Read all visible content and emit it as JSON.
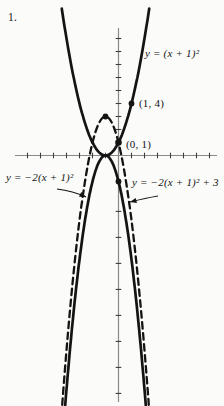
{
  "figure": {
    "number": "1.",
    "background": "#fbfbf9",
    "curve_color": "#141414",
    "axis_color": "#8a8a8a",
    "tick_color": "#3c3c3c"
  },
  "chart_data": {
    "type": "line",
    "functions": [
      {
        "label": "y = (x + 1)²",
        "a": 1,
        "h": -1,
        "k": 0,
        "style": "solid",
        "x_min": -4.36,
        "x_max": 2.36
      },
      {
        "label": "y = −2(x + 1)²",
        "a": -2,
        "h": -1,
        "k": 0,
        "style": "solid",
        "x_min": -4.1,
        "x_max": 2.1
      },
      {
        "label": "y = −2(x + 1)² + 3",
        "a": -2,
        "h": -1,
        "k": 3,
        "style": "dashed",
        "x_min": -4.33,
        "x_max": 2.33
      }
    ],
    "marked_points": [
      {
        "x": 1,
        "y": 4,
        "r": 2.9,
        "label": "(1, 4)"
      },
      {
        "x": 0,
        "y": 1,
        "r": 3.3,
        "label": "(0, 1)"
      },
      {
        "x": -1,
        "y": 3,
        "r": 2.9,
        "label": ""
      },
      {
        "x": 0,
        "y": -2,
        "r": 2.9,
        "label": ""
      }
    ],
    "axes": {
      "origin_px": {
        "x": 118.5,
        "y": 155.5
      },
      "unit_px": 13,
      "x_axis_px": {
        "y": 155.5,
        "x1": 15,
        "x2": 217
      },
      "y_axis_px": {
        "x": 118.5,
        "y1": 28,
        "y2": 402
      },
      "x_ticks": [
        -7,
        -6,
        -5,
        -4,
        -3,
        -2,
        -1,
        1,
        2,
        3,
        4,
        5,
        6,
        7
      ],
      "y_ticks": [
        2,
        3,
        4,
        5,
        6,
        7,
        8,
        9,
        -4.3,
        -6.3,
        -8.3,
        -10.3,
        -12.3,
        -14.3,
        -16.3,
        -18.3
      ],
      "grid": false
    },
    "labels": {
      "eq_up": "y = (x + 1)²",
      "eq_down": "y = −2(x + 1)²",
      "eq_down_shift": "y = −2(x + 1)² + 3",
      "pt_14": "(1, 4)",
      "pt_01": "(0, 1)"
    },
    "annotations": [
      {
        "name": "arrow-to-solid-down-parabola",
        "from": [
          57,
          189
        ],
        "ctrl": [
          73,
          191
        ],
        "to": [
          86,
          197
        ]
      },
      {
        "name": "arrow-to-dashed-parabola",
        "from": [
          158,
          196
        ],
        "ctrl": [
          146,
          198
        ],
        "to": [
          130,
          202
        ]
      }
    ]
  }
}
